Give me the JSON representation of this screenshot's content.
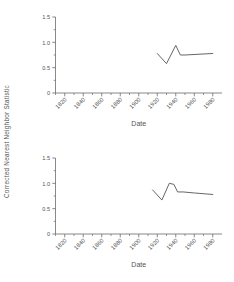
{
  "figure": {
    "shared_ylabel": "Corrected Nearest Neighbor Statistic",
    "line_color": "#555555",
    "axis_color": "#6b6b6b"
  },
  "chart_data": [
    {
      "type": "line",
      "panel": "top",
      "title": "",
      "xlabel": "Date",
      "ylabel": "Corrected Nearest Neighbor Statistic",
      "xlim": [
        1810,
        1990
      ],
      "ylim": [
        0,
        1.5
      ],
      "yticks": [
        0,
        0.5,
        1.0,
        1.5
      ],
      "ytick_labels": [
        "0",
        "0.5",
        "1.0",
        "1.5"
      ],
      "xticks": [
        1820,
        1840,
        1860,
        1880,
        1900,
        1920,
        1940,
        1960,
        1980
      ],
      "xtick_labels": [
        "1820",
        "1840",
        "1860",
        "1880",
        "1900",
        "1920",
        "1940",
        "1960",
        "1980"
      ],
      "minor_ticks": true,
      "grid": false,
      "legend": null,
      "x": [
        1920,
        1930,
        1940,
        1945,
        1950,
        1980
      ],
      "values": [
        0.78,
        0.58,
        0.94,
        0.75,
        0.75,
        0.78
      ]
    },
    {
      "type": "line",
      "panel": "bottom",
      "title": "",
      "xlabel": "Date",
      "ylabel": "Corrected Nearest Neighbor Statistic",
      "xlim": [
        1810,
        1990
      ],
      "ylim": [
        0,
        1.5
      ],
      "yticks": [
        0,
        0.5,
        1.0,
        1.5
      ],
      "ytick_labels": [
        "0",
        "0.5",
        "1.0",
        "1.5"
      ],
      "xticks": [
        1820,
        1840,
        1860,
        1880,
        1900,
        1920,
        1940,
        1960,
        1980
      ],
      "xtick_labels": [
        "1820",
        "1840",
        "1860",
        "1880",
        "1900",
        "1920",
        "1940",
        "1960",
        "1980"
      ],
      "minor_ticks": true,
      "grid": false,
      "legend": null,
      "x": [
        1915,
        1925,
        1933,
        1938,
        1942,
        1948,
        1960,
        1980
      ],
      "values": [
        0.87,
        0.67,
        1.0,
        0.98,
        0.83,
        0.83,
        0.81,
        0.78
      ]
    }
  ]
}
